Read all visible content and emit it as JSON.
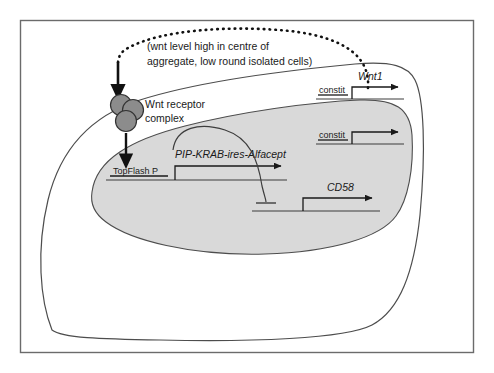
{
  "figure": {
    "frame": {
      "border_color": "#6b6b6b",
      "background": "#ffffff"
    },
    "cell": {
      "membrane_color": "#4d4d4d",
      "cytoplasm_fill": "#ffffff",
      "label": "cell"
    },
    "nucleus": {
      "fill_color": "#d9d9d9",
      "outline_color": "#4d4d4d",
      "label": "nucleus"
    },
    "annotation": {
      "line1": "(wnt level high in centre of",
      "line2": "aggregate, low round isolated cells)",
      "connector_style": "dotted"
    },
    "receptor": {
      "label_line1": "Wnt receptor",
      "label_line2": "complex",
      "circle_fill": "#8c8c8c",
      "circle_stroke": "#333333",
      "circle_count": 3
    },
    "constructs": [
      {
        "id": "pip-krab",
        "promoter": "TopFlash P",
        "gene": "PIP-KRAB-ires-Alfacept",
        "promoter_type": "inducible",
        "location": "nucleus"
      },
      {
        "id": "wnt1",
        "promoter": "constit",
        "gene": "Wnt1",
        "promoter_type": "constitutive",
        "location": "nucleus"
      },
      {
        "id": "cd2",
        "promoter": "constit",
        "gene": "CD2",
        "promoter_type": "constitutive",
        "location": "nucleus"
      },
      {
        "id": "cd58",
        "promoter": "",
        "gene": "CD58",
        "promoter_type": "repressible",
        "location": "nucleus"
      }
    ],
    "arrows": [
      {
        "id": "wnt-to-receptor",
        "type": "activation",
        "style": "solid-arrow",
        "from": "extracellular wnt",
        "to": "Wnt receptor complex"
      },
      {
        "id": "receptor-to-topflash",
        "type": "activation",
        "style": "solid-arrow",
        "from": "Wnt receptor complex",
        "to": "TopFlash P"
      },
      {
        "id": "pipkrab-to-cd58",
        "type": "inhibition",
        "style": "t-bar",
        "from": "PIP-KRAB-ires-Alfacept",
        "to": "CD58"
      }
    ]
  }
}
